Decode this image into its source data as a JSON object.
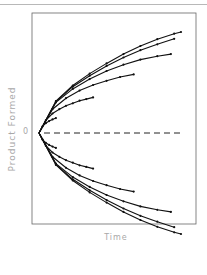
{
  "chart_data": {
    "type": "line",
    "title": "",
    "xlabel": "Time",
    "ylabel": "Product Formed",
    "y_tick_labels": [
      "0"
    ],
    "grid": false,
    "legend": null,
    "reference_line": {
      "y": 0,
      "style": "dashed"
    },
    "annotations": [],
    "note": "Symmetric family of progress curves: 6 curves above 0 and 6 mirrored below 0, all starting at origin; curves differ in duration and curvature.",
    "series": [
      {
        "name": "upper-1",
        "points": [
          [
            0,
            0
          ],
          [
            2,
            1.5
          ],
          [
            4,
            2.3
          ],
          [
            6,
            2.8
          ],
          [
            8,
            3.2
          ],
          [
            10,
            3.5
          ]
        ]
      },
      {
        "name": "upper-2",
        "points": [
          [
            0,
            0
          ],
          [
            4,
            3.0
          ],
          [
            8,
            4.6
          ],
          [
            12,
            5.6
          ],
          [
            16,
            6.4
          ],
          [
            20,
            7.0
          ],
          [
            24,
            7.6
          ],
          [
            28,
            8.0
          ],
          [
            32,
            8.4
          ]
        ]
      },
      {
        "name": "upper-3",
        "points": [
          [
            0,
            0
          ],
          [
            8,
            5.6
          ],
          [
            16,
            8.2
          ],
          [
            24,
            10.0
          ],
          [
            32,
            11.3
          ],
          [
            40,
            12.3
          ],
          [
            48,
            13.2
          ],
          [
            56,
            13.8
          ]
        ]
      },
      {
        "name": "upper-4",
        "points": [
          [
            0,
            0
          ],
          [
            10,
            7.2
          ],
          [
            20,
            10.4
          ],
          [
            30,
            12.7
          ],
          [
            40,
            14.6
          ],
          [
            50,
            16.1
          ],
          [
            60,
            17.3
          ],
          [
            70,
            18.1
          ],
          [
            78,
            18.6
          ]
        ]
      },
      {
        "name": "upper-5",
        "points": [
          [
            0,
            0
          ],
          [
            10,
            7.4
          ],
          [
            20,
            10.9
          ],
          [
            30,
            13.5
          ],
          [
            40,
            15.8
          ],
          [
            50,
            17.8
          ],
          [
            60,
            19.5
          ],
          [
            70,
            20.9
          ],
          [
            80,
            22.2
          ]
        ]
      },
      {
        "name": "upper-6",
        "points": [
          [
            0,
            0
          ],
          [
            10,
            7.5
          ],
          [
            20,
            11.2
          ],
          [
            30,
            14.0
          ],
          [
            40,
            16.4
          ],
          [
            50,
            18.6
          ],
          [
            60,
            20.5
          ],
          [
            70,
            22.1
          ],
          [
            80,
            23.4
          ],
          [
            84,
            23.8
          ]
        ]
      },
      {
        "name": "lower-1",
        "points": [
          [
            0,
            0
          ],
          [
            2,
            -1.5
          ],
          [
            4,
            -2.3
          ],
          [
            6,
            -2.8
          ],
          [
            8,
            -3.2
          ],
          [
            10,
            -3.5
          ]
        ]
      },
      {
        "name": "lower-2",
        "points": [
          [
            0,
            0
          ],
          [
            4,
            -3.0
          ],
          [
            8,
            -4.6
          ],
          [
            12,
            -5.6
          ],
          [
            16,
            -6.4
          ],
          [
            20,
            -7.0
          ],
          [
            24,
            -7.6
          ],
          [
            28,
            -8.0
          ],
          [
            32,
            -8.4
          ]
        ]
      },
      {
        "name": "lower-3",
        "points": [
          [
            0,
            0
          ],
          [
            8,
            -5.6
          ],
          [
            16,
            -8.2
          ],
          [
            24,
            -10.0
          ],
          [
            32,
            -11.3
          ],
          [
            40,
            -12.3
          ],
          [
            48,
            -13.2
          ],
          [
            56,
            -13.8
          ]
        ]
      },
      {
        "name": "lower-4",
        "points": [
          [
            0,
            0
          ],
          [
            10,
            -7.2
          ],
          [
            20,
            -10.4
          ],
          [
            30,
            -12.7
          ],
          [
            40,
            -14.6
          ],
          [
            50,
            -16.1
          ],
          [
            60,
            -17.3
          ],
          [
            70,
            -18.1
          ],
          [
            78,
            -18.6
          ]
        ]
      },
      {
        "name": "lower-5",
        "points": [
          [
            0,
            0
          ],
          [
            10,
            -7.4
          ],
          [
            20,
            -10.9
          ],
          [
            30,
            -13.5
          ],
          [
            40,
            -15.8
          ],
          [
            50,
            -17.8
          ],
          [
            60,
            -19.5
          ],
          [
            70,
            -20.9
          ],
          [
            80,
            -22.2
          ]
        ]
      },
      {
        "name": "lower-6",
        "points": [
          [
            0,
            0
          ],
          [
            10,
            -7.5
          ],
          [
            20,
            -11.2
          ],
          [
            30,
            -14.0
          ],
          [
            40,
            -16.4
          ],
          [
            50,
            -18.6
          ],
          [
            60,
            -20.5
          ],
          [
            70,
            -22.1
          ],
          [
            80,
            -23.4
          ],
          [
            84,
            -23.8
          ]
        ]
      }
    ],
    "xlim": [
      0,
      90
    ],
    "ylim": [
      -28,
      28
    ]
  },
  "labels": {
    "x_axis": "Time",
    "y_axis": "Product Formed",
    "zero_tick": "0"
  },
  "colors": {
    "curve": "#111111",
    "axis_text": "#a8a8a8",
    "frame": "#555555"
  }
}
